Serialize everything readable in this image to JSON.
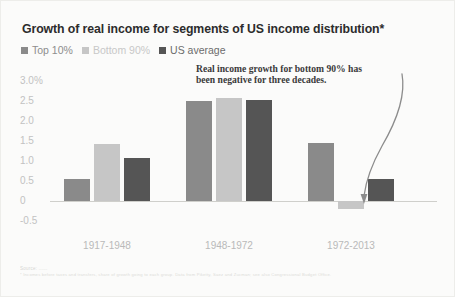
{
  "chart_data": {
    "type": "bar",
    "title": "Growth of real income for segments of US income distribution*",
    "xlabel": "",
    "ylabel": "",
    "categories": [
      "1917-1948",
      "1948-1972",
      "1972-2013"
    ],
    "series": [
      {
        "name": "Top 10%",
        "color": "#8a8a8a",
        "values": [
          0.55,
          2.5,
          1.45
        ]
      },
      {
        "name": "Bottom 90%",
        "color": "#c6c6c6",
        "values": [
          1.42,
          2.57,
          -0.2
        ]
      },
      {
        "name": "US average",
        "color": "#555555",
        "values": [
          1.07,
          2.52,
          0.55
        ]
      }
    ],
    "ylim": [
      -0.5,
      3.0
    ],
    "yticks": [
      "3.0%",
      "2.5",
      "2.0",
      "1.5",
      "1.0",
      "0.5",
      "0",
      "-0.5"
    ],
    "ytick_values": [
      3.0,
      2.5,
      2.0,
      1.5,
      1.0,
      0.5,
      0,
      -0.5
    ],
    "grid": false,
    "zero_line": true,
    "legend_position": "top-left",
    "annotations": [
      {
        "text": "Real income growth for bottom 90% has been negative for three decades.",
        "points_to": {
          "category": "1972-2013",
          "series": "Bottom 90%"
        },
        "arrow": "curved"
      }
    ]
  },
  "legend": {
    "items": [
      {
        "label": "Top 10%",
        "color": "#8a8a8a"
      },
      {
        "label": "Bottom 90%",
        "color": "#c6c6c6"
      },
      {
        "label": "US average",
        "color": "#555555"
      }
    ]
  },
  "footnote": {
    "line1": "Source: ......",
    "line2": "* Incomes before taxes and transfers, share of growth going to each group. Data from Piketty, Saez and Zucman; see also Congressional Budget Office."
  },
  "colors": {
    "background": "#fbfbfa",
    "title": "#2c2c2c",
    "axis_text": "#c2c2c2",
    "zero_line": "#cfcfcb"
  }
}
